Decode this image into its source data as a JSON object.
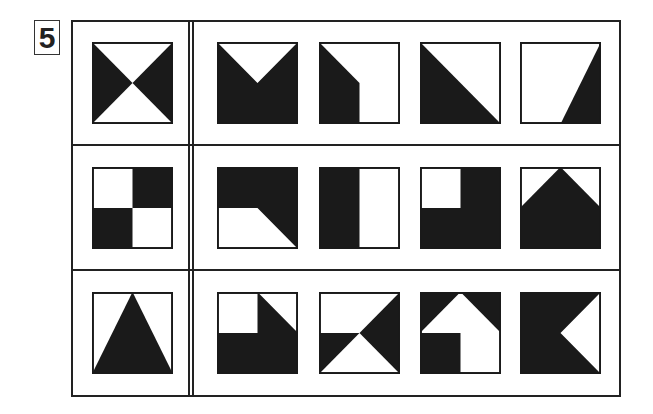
{
  "puzzle": {
    "number": "5",
    "colors": {
      "ink": "#1a1a1a",
      "paper": "#ffffff",
      "frame": "#222222"
    },
    "rows": [
      {
        "question": {
          "name": "bowtie-left-right-black",
          "polygons": [
            [
              "0,0",
              "50,50",
              "0,100"
            ],
            [
              "100,0",
              "50,50",
              "100,100"
            ]
          ]
        },
        "options": [
          {
            "label": "option-1",
            "name": "v-notch-top",
            "polygons": [
              [
                "0,0",
                "50,50",
                "100,0",
                "100,100",
                "0,100"
              ]
            ]
          },
          {
            "label": "option-2",
            "name": "left-black-chamfer",
            "polygons": [
              [
                "0,0",
                "50,50",
                "50,100",
                "0,100"
              ]
            ]
          },
          {
            "label": "option-3",
            "name": "lower-left-triangle",
            "polygons": [
              [
                "0,0",
                "100,100",
                "0,100"
              ]
            ]
          },
          {
            "label": "option-4",
            "name": "right-sliver-triangle",
            "polygons": [
              [
                "100,0",
                "100,100",
                "50,100"
              ]
            ]
          }
        ]
      },
      {
        "question": {
          "name": "checkerboard-2x2",
          "polygons": [
            [
              "50,0",
              "100,0",
              "100,50",
              "50,50"
            ],
            [
              "0,50",
              "50,50",
              "50,100",
              "0,100"
            ]
          ]
        },
        "options": [
          {
            "label": "option-1",
            "name": "top-black-with-slope",
            "polygons": [
              [
                "0,0",
                "100,0",
                "100,100",
                "50,50",
                "0,50"
              ]
            ]
          },
          {
            "label": "option-2",
            "name": "left-half-black",
            "polygons": [
              [
                "0,0",
                "50,0",
                "50,100",
                "0,100"
              ]
            ]
          },
          {
            "label": "option-3",
            "name": "white-top-left-quadrant",
            "polygons": [
              [
                "50,0",
                "100,0",
                "100,100",
                "0,100",
                "0,50",
                "50,50"
              ]
            ]
          },
          {
            "label": "option-4",
            "name": "house-shape",
            "polygons": [
              [
                "0,50",
                "50,0",
                "100,50",
                "100,100",
                "0,100"
              ]
            ]
          }
        ]
      },
      {
        "question": {
          "name": "center-triangle",
          "polygons": [
            [
              "50,0",
              "100,100",
              "0,100"
            ]
          ]
        },
        "options": [
          {
            "label": "option-1",
            "name": "bottom-black-with-slope",
            "polygons": [
              [
                "50,0",
                "100,50",
                "100,100",
                "0,100",
                "0,50",
                "50,50"
              ]
            ]
          },
          {
            "label": "option-2",
            "name": "split-triangles",
            "polygons": [
              [
                "100,0",
                "100,100",
                "50,50"
              ],
              [
                "0,50",
                "50,50",
                "0,100"
              ]
            ]
          },
          {
            "label": "option-3",
            "name": "white-arrow-shape",
            "polygons": [
              [
                "0,0",
                "50,0",
                "0,50"
              ],
              [
                "50,0",
                "100,0",
                "100,50"
              ],
              [
                "0,50",
                "50,50",
                "50,100",
                "0,100"
              ]
            ]
          },
          {
            "label": "option-4",
            "name": "white-right-notch",
            "polygons": [
              [
                "0,0",
                "100,0",
                "50,50",
                "100,100",
                "0,100"
              ]
            ]
          }
        ]
      }
    ]
  }
}
